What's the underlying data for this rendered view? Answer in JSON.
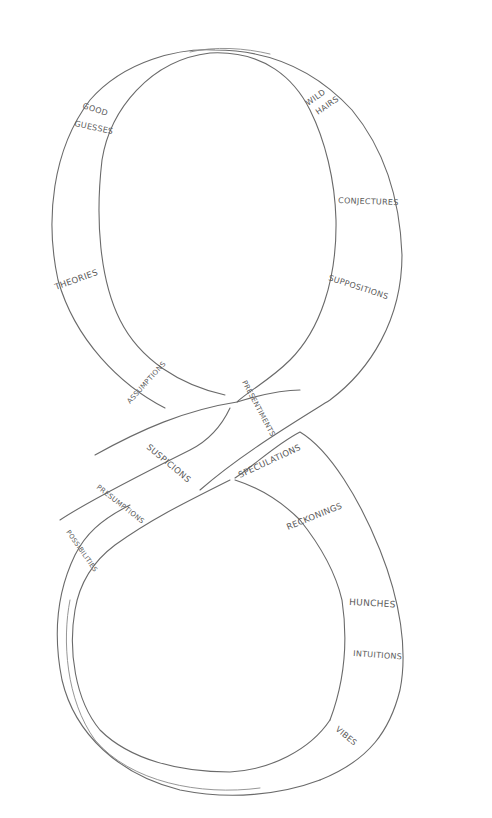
{
  "figure": {
    "kind": "hand-drawn figure-eight band",
    "stroke_color": "#6a6a6a",
    "background": "#ffffff"
  },
  "labels": {
    "good_guesses_1": "GOOD",
    "good_guesses_2": "GUESSES",
    "wild_hairs_1": "WILD",
    "wild_hairs_2": "HAIRS",
    "conjectures": "CONJECTURES",
    "theories": "THEORIES",
    "suppositions": "SUPPOSITIONS",
    "assumptions": "ASSUMPTIONS",
    "presentiments": "PRESENTIMENTS",
    "speculations": "SPECULATIONS",
    "suspicions": "SUSPICIONS",
    "presumptions": "PRESUMPTIONS",
    "possibilities": "POSSIBILITIES",
    "reckonings": "RECKONINGS",
    "hunches": "HUNCHES",
    "intuitions": "INTUITIONS",
    "vibes": "VIBES"
  }
}
